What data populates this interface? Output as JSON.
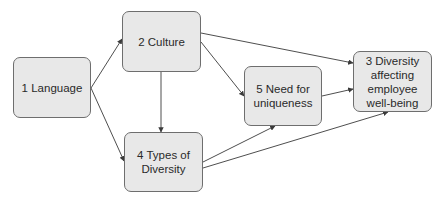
{
  "diagram": {
    "type": "flowchart",
    "colors": {
      "background": "#ffffff",
      "node_fill": "#e8e8e8",
      "node_border": "#6e6e6e",
      "edge": "#3a3a3a",
      "text": "#2a2a2a"
    },
    "nodes": [
      {
        "id": "1",
        "label": "1 Language",
        "x": 13,
        "y": 57,
        "w": 78,
        "h": 61
      },
      {
        "id": "2",
        "label": "2 Culture",
        "x": 122,
        "y": 11,
        "w": 79,
        "h": 61
      },
      {
        "id": "3",
        "label": "3 Diversity\naffecting\nemployee\nwell-being",
        "x": 353,
        "y": 51,
        "w": 79,
        "h": 61
      },
      {
        "id": "4",
        "label": "4 Types of\nDiversity",
        "x": 124,
        "y": 132,
        "w": 79,
        "h": 60
      },
      {
        "id": "5",
        "label": "5 Need for\nuniqueness",
        "x": 244,
        "y": 66,
        "w": 78,
        "h": 60
      }
    ],
    "edges": [
      {
        "from": "1",
        "to": "2",
        "x1": 91,
        "y1": 88,
        "x2": 122,
        "y2": 39
      },
      {
        "from": "1",
        "to": "4",
        "x1": 91,
        "y1": 88,
        "x2": 124,
        "y2": 161
      },
      {
        "from": "2",
        "to": "4",
        "x1": 161,
        "y1": 72,
        "x2": 161,
        "y2": 132
      },
      {
        "from": "2",
        "to": "5",
        "x1": 201,
        "y1": 42,
        "x2": 244,
        "y2": 96
      },
      {
        "from": "2",
        "to": "3",
        "x1": 201,
        "y1": 33,
        "x2": 353,
        "y2": 63
      },
      {
        "from": "5",
        "to": "3",
        "x1": 322,
        "y1": 96,
        "x2": 353,
        "y2": 89
      },
      {
        "from": "4",
        "to": "5",
        "x1": 203,
        "y1": 162,
        "x2": 275,
        "y2": 126
      },
      {
        "from": "4",
        "to": "3",
        "x1": 203,
        "y1": 168,
        "x2": 388,
        "y2": 112
      }
    ]
  }
}
